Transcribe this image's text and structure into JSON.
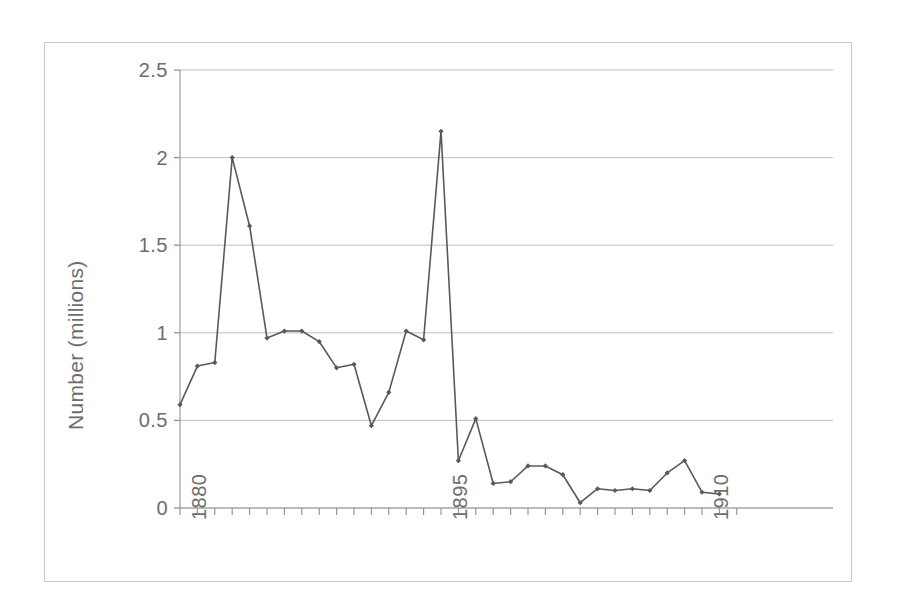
{
  "chart_data": {
    "type": "line",
    "title": "",
    "subtitle": "",
    "xlabel": "",
    "ylabel": "Number (millions)",
    "xlim": [
      1879,
      1912
    ],
    "ylim": [
      0,
      2.5
    ],
    "grid": "horizontal",
    "legend": "none",
    "marker": "filled-diamond",
    "line_color": "#595959",
    "grid_color": "#bfbfbf",
    "axis_color": "#808080",
    "frame_color": "#c9c9c9",
    "background": "#ffffff",
    "y_ticks": [
      {
        "value": 0,
        "label": "0"
      },
      {
        "value": 0.5,
        "label": "0.5"
      },
      {
        "value": 1,
        "label": "1"
      },
      {
        "value": 1.5,
        "label": "1.5"
      },
      {
        "value": 2,
        "label": "2"
      },
      {
        "value": 2.5,
        "label": "2.5"
      }
    ],
    "x_ticks_labeled": [
      {
        "value": 1880,
        "label": "1880"
      },
      {
        "value": 1895,
        "label": "1895"
      },
      {
        "value": 1910,
        "label": "1910"
      }
    ],
    "x_tick_interval": 1,
    "x": [
      1880,
      1881,
      1882,
      1883,
      1884,
      1885,
      1886,
      1887,
      1888,
      1889,
      1890,
      1891,
      1892,
      1893,
      1894,
      1895,
      1896,
      1897,
      1898,
      1899,
      1900,
      1901,
      1902,
      1903,
      1904,
      1905,
      1906,
      1907,
      1908,
      1909,
      1910,
      1911
    ],
    "categories": [
      "1880",
      "1881",
      "1882",
      "1883",
      "1884",
      "1885",
      "1886",
      "1887",
      "1888",
      "1889",
      "1890",
      "1891",
      "1892",
      "1893",
      "1894",
      "1895",
      "1896",
      "1897",
      "1898",
      "1899",
      "1900",
      "1901",
      "1902",
      "1903",
      "1904",
      "1905",
      "1906",
      "1907",
      "1908",
      "1909",
      "1910",
      "1911"
    ],
    "values": [
      0.59,
      0.81,
      0.83,
      2.0,
      1.61,
      0.97,
      1.01,
      1.01,
      0.95,
      0.8,
      0.82,
      0.47,
      0.66,
      1.01,
      0.96,
      2.15,
      0.27,
      0.51,
      0.14,
      0.15,
      0.24,
      0.24,
      0.19,
      0.03,
      0.11,
      0.1,
      0.11,
      0.1,
      0.2,
      0.27,
      0.09,
      0.08
    ],
    "series": [
      {
        "name": "Number (millions)",
        "values": [
          0.59,
          0.81,
          0.83,
          2.0,
          1.61,
          0.97,
          1.01,
          1.01,
          0.95,
          0.8,
          0.82,
          0.47,
          0.66,
          1.01,
          0.96,
          2.15,
          0.27,
          0.51,
          0.14,
          0.15,
          0.24,
          0.24,
          0.19,
          0.03,
          0.11,
          0.1,
          0.11,
          0.1,
          0.2,
          0.27,
          0.09,
          0.08
        ]
      }
    ]
  }
}
